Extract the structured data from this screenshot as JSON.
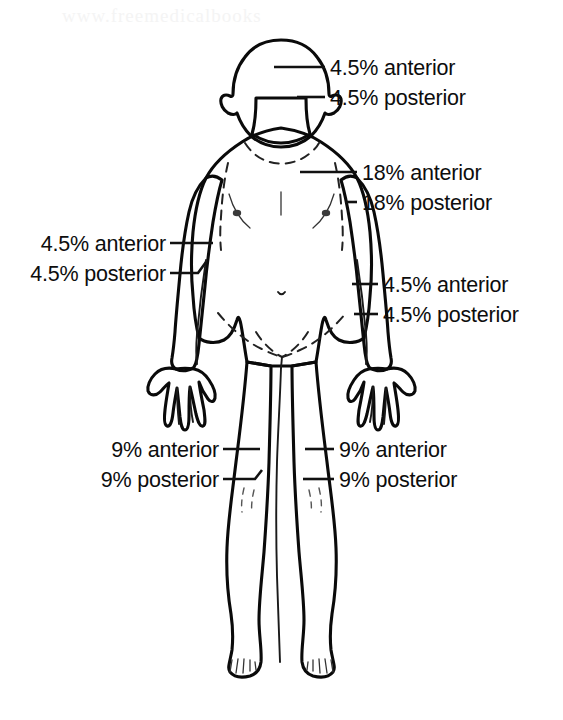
{
  "page": {
    "background_color": "#ffffff",
    "watermark_text": "www.freemedicalbooks"
  },
  "figure": {
    "name": "anterior-body-diagram",
    "orientation": "anterior view, child figure, arms at sides",
    "colors": {
      "head_fill": "#b6b6b6",
      "torso_fill": "#dedede",
      "limb_fill": "#ededed",
      "outline": "#0a0a0a",
      "text": "#0d0d0d"
    }
  },
  "labels": {
    "head": {
      "name": "head-label-group",
      "side": "right",
      "anterior": "4.5% anterior",
      "posterior": "4.5% posterior",
      "anterior_x": 330,
      "anterior_y": 75,
      "posterior_x": 330,
      "posterior_y": 105
    },
    "trunk": {
      "name": "trunk-label-group",
      "side": "right",
      "anterior": "18% anterior",
      "posterior": "18% posterior",
      "anterior_x": 362,
      "anterior_y": 180,
      "posterior_x": 362,
      "posterior_y": 210
    },
    "arm_left": {
      "name": "left-arm-label-group",
      "side": "left",
      "anterior": "4.5% anterior",
      "posterior": "4.5% posterior",
      "anterior_x": 163,
      "anterior_y": 250,
      "posterior_x": 163,
      "posterior_y": 280
    },
    "arm_right": {
      "name": "right-arm-label-group",
      "side": "right",
      "anterior": "4.5% anterior",
      "posterior": "4.5% posterior",
      "anterior_x": 383,
      "anterior_y": 292,
      "posterior_x": 383,
      "posterior_y": 322
    },
    "leg_left": {
      "name": "left-leg-label-group",
      "side": "left",
      "anterior": "9% anterior",
      "posterior": "9% posterior",
      "anterior_x": 216,
      "anterior_y": 457,
      "posterior_x": 216,
      "posterior_y": 487
    },
    "leg_right": {
      "name": "right-leg-label-group",
      "side": "right",
      "anterior": "9% anterior",
      "posterior": "9% posterior",
      "anterior_x": 339,
      "anterior_y": 457,
      "posterior_x": 339,
      "posterior_y": 487
    }
  },
  "percentages": {
    "head_anterior": 4.5,
    "head_posterior": 4.5,
    "trunk_anterior": 18,
    "trunk_posterior": 18,
    "arm_each_anterior": 4.5,
    "arm_each_posterior": 4.5,
    "leg_each_anterior": 9,
    "leg_each_posterior": 9
  }
}
